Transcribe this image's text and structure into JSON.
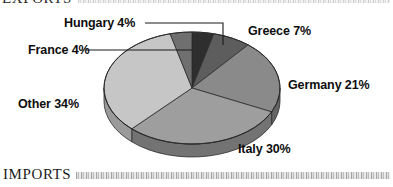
{
  "document": {
    "exports_heading": "EXPORTS",
    "imports_heading": "IMPORTS"
  },
  "chart_data": {
    "type": "pie",
    "title": "EXPORTS",
    "xlabel": "",
    "ylabel": "",
    "grid": false,
    "legend_position": "callout-labels",
    "three_d": true,
    "start_angle_deg": 0,
    "direction": "clockwise",
    "units": "percent",
    "total": 100,
    "categories": [
      "Hungary",
      "Greece",
      "Germany",
      "Italy",
      "Other",
      "France"
    ],
    "values": [
      4,
      7,
      21,
      30,
      34,
      4
    ],
    "labels": [
      "Hungary 4%",
      "Greece 7%",
      "Germany 21%",
      "Italy 30%",
      "Other 34%",
      "France 4%"
    ],
    "slices": [
      {
        "name": "Hungary",
        "label": "Hungary 4%",
        "value": 4,
        "color": "#2e2e2e",
        "side_color": "#1d1d1d",
        "has_leader_line": true
      },
      {
        "name": "Greece",
        "label": "Greece 7%",
        "value": 7,
        "color": "#5d5d5d",
        "side_color": "#3f3f3f",
        "has_leader_line": false
      },
      {
        "name": "Germany",
        "label": "Germany 21%",
        "value": 21,
        "color": "#8a8a8a",
        "side_color": "#646464",
        "has_leader_line": false
      },
      {
        "name": "Italy",
        "label": "Italy 30%",
        "value": 30,
        "color": "#9e9e9e",
        "side_color": "#737373",
        "has_leader_line": false
      },
      {
        "name": "Other",
        "label": "Other 34%",
        "value": 34,
        "color": "#c6c6c6",
        "side_color": "#9a9a9a",
        "has_leader_line": false
      },
      {
        "name": "France",
        "label": "France 4%",
        "value": 4,
        "color": "#6f6f6f",
        "side_color": "#4d4d4d",
        "has_leader_line": true
      }
    ]
  }
}
